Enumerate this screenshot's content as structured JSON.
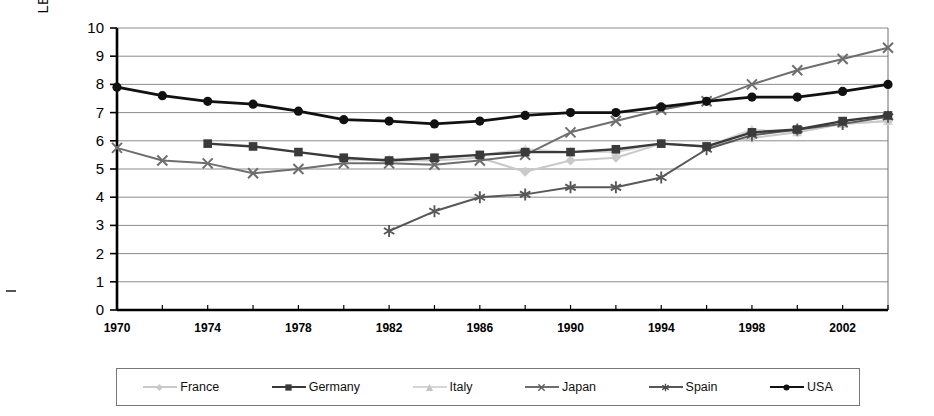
{
  "chart_data": {
    "type": "line",
    "title": "",
    "xlabel": "",
    "ylabel": "LBW – % of live births",
    "xlim": [
      1970,
      2004
    ],
    "ylim": [
      0,
      10
    ],
    "ytick_step": 1,
    "xtick_step": 4,
    "grid": "horizontal",
    "legend_position": "bottom",
    "yticks": [
      "0",
      "1",
      "2",
      "3",
      "4",
      "5",
      "6",
      "7",
      "8",
      "9",
      "10"
    ],
    "xticks": [
      "1970",
      "1974",
      "1978",
      "1982",
      "1986",
      "1990",
      "1994",
      "1998",
      "2002"
    ],
    "x": [
      1970,
      1972,
      1974,
      1976,
      1978,
      1980,
      1982,
      1984,
      1986,
      1988,
      1990,
      1992,
      1994,
      1996,
      1998,
      2000,
      2002,
      2004
    ],
    "series": [
      {
        "name": "France",
        "color": "#c9c9c9",
        "marker": "diamond",
        "x": [
          1980,
          1982,
          1984,
          1986,
          1988,
          1990,
          1992,
          1994,
          1996,
          1998,
          2000,
          2002,
          2004
        ],
        "values": [
          5.4,
          5.3,
          5.3,
          5.4,
          4.9,
          5.3,
          5.4,
          5.9,
          5.8,
          6.1,
          6.3,
          6.6,
          6.7
        ]
      },
      {
        "name": "Germany",
        "color": "#3a3a3a",
        "marker": "square",
        "x": [
          1974,
          1976,
          1978,
          1980,
          1982,
          1984,
          1986,
          1988,
          1990,
          1992,
          1994,
          1996,
          1998,
          2000,
          2002,
          2004
        ],
        "values": [
          5.9,
          5.8,
          5.6,
          5.4,
          5.3,
          5.4,
          5.5,
          5.6,
          5.6,
          5.7,
          5.9,
          5.8,
          6.3,
          6.4,
          6.7,
          6.9
        ]
      },
      {
        "name": "Italy",
        "color": "#d6d6d6",
        "marker": "triangle",
        "x": [
          1980,
          1982,
          1984,
          1986,
          1988,
          1990,
          1992,
          1994,
          1996,
          1998,
          2000,
          2002,
          2004
        ],
        "values": [
          5.3,
          5.35,
          5.4,
          5.5,
          5.7,
          5.6,
          5.6,
          5.9,
          5.8,
          6.4,
          6.3,
          6.6,
          6.7
        ]
      },
      {
        "name": "Japan",
        "color": "#6e6e6e",
        "marker": "x",
        "x": [
          1970,
          1972,
          1974,
          1976,
          1978,
          1980,
          1982,
          1984,
          1986,
          1988,
          1990,
          1992,
          1994,
          1996,
          1998,
          2000,
          2002,
          2004
        ],
        "values": [
          5.75,
          5.3,
          5.2,
          4.85,
          5.0,
          5.2,
          5.2,
          5.15,
          5.3,
          5.5,
          6.3,
          6.7,
          7.1,
          7.4,
          8.0,
          8.5,
          8.9,
          9.3
        ]
      },
      {
        "name": "Spain",
        "color": "#585858",
        "marker": "asterisk",
        "x": [
          1982,
          1984,
          1986,
          1988,
          1990,
          1992,
          1994,
          1996,
          1998,
          2000,
          2002,
          2004
        ],
        "values": [
          2.8,
          3.5,
          4.0,
          4.1,
          4.35,
          4.35,
          4.7,
          5.7,
          6.2,
          6.4,
          6.6,
          6.85
        ]
      },
      {
        "name": "USA",
        "color": "#111111",
        "marker": "circle",
        "x": [
          1970,
          1972,
          1974,
          1976,
          1978,
          1980,
          1982,
          1984,
          1986,
          1988,
          1990,
          1992,
          1994,
          1996,
          1998,
          2000,
          2002,
          2004
        ],
        "values": [
          7.9,
          7.6,
          7.4,
          7.3,
          7.05,
          6.75,
          6.7,
          6.6,
          6.7,
          6.9,
          7.0,
          7.0,
          7.2,
          7.4,
          7.55,
          7.55,
          7.75,
          8.0
        ]
      }
    ]
  },
  "legend": {
    "items": [
      {
        "label": "France"
      },
      {
        "label": "Germany"
      },
      {
        "label": "Italy"
      },
      {
        "label": "Japan"
      },
      {
        "label": "Spain"
      },
      {
        "label": "USA"
      }
    ]
  }
}
